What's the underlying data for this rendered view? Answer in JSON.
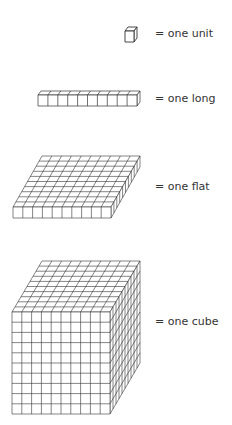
{
  "items": [
    {
      "name": "unit",
      "label": "= one unit"
    },
    {
      "name": "long",
      "label": "= one long"
    },
    {
      "name": "flat",
      "label": "= one flat"
    },
    {
      "name": "cube",
      "label": "= one cube"
    }
  ],
  "colors": {
    "line": "#333333",
    "background": "#ffffff"
  }
}
